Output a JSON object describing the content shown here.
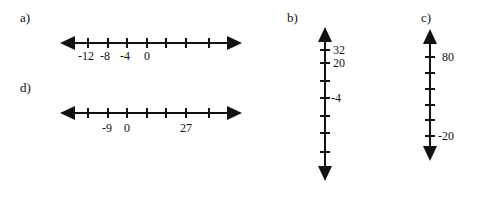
{
  "problems": [
    {
      "id": "a",
      "label": "a)",
      "orientation": "horizontal",
      "tick_count": 7,
      "labels": [
        {
          "tick": 0,
          "text": "-12"
        },
        {
          "tick": 1,
          "text": "-8"
        },
        {
          "tick": 2,
          "text": "-4"
        },
        {
          "tick": 3,
          "text": "0"
        }
      ]
    },
    {
      "id": "b",
      "label": "b)",
      "orientation": "vertical",
      "tick_count": 7,
      "labels": [
        {
          "tick": 0,
          "text": "32"
        },
        {
          "tick": 1,
          "text": "20"
        },
        {
          "tick": 3,
          "text": "-4"
        }
      ]
    },
    {
      "id": "c",
      "label": "c)",
      "orientation": "vertical",
      "tick_count": 6,
      "labels": [
        {
          "tick": 0,
          "text": "80"
        },
        {
          "tick": 5,
          "text": "-20"
        }
      ]
    },
    {
      "id": "d",
      "label": "d)",
      "orientation": "horizontal",
      "tick_count": 7,
      "labels": [
        {
          "tick": 1,
          "text": "-9"
        },
        {
          "tick": 2,
          "text": "0"
        },
        {
          "tick": 5,
          "text": "27"
        }
      ]
    }
  ],
  "text": {
    "a_label": "a)",
    "b_label": "b)",
    "c_label": "c)",
    "d_label": "d)",
    "a_t0": "-12",
    "a_t1": "-8",
    "a_t2": "-4",
    "a_t3": "0",
    "b_t0": "32",
    "b_t1": "20",
    "b_t3": "-4",
    "c_t0": "80",
    "c_t5": "-20",
    "d_t1": "-9",
    "d_t2": "0",
    "d_t5": "27"
  }
}
